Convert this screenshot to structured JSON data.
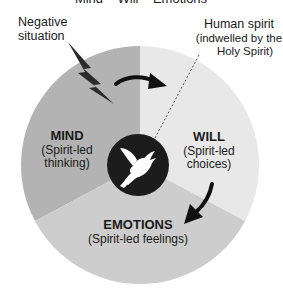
{
  "title": "Mind – Will – Emotions",
  "callouts": {
    "negative_situation": {
      "line1": "Negative",
      "line2": "situation"
    },
    "human_spirit": {
      "line1": "Human spirit",
      "line2": "(indwelled by the",
      "line3": "Holy Spirit)"
    }
  },
  "sectors": {
    "mind": {
      "title": "MIND",
      "sub1": "(Spirit-led",
      "sub2": "thinking)",
      "color": "#b3b3b3"
    },
    "will": {
      "title": "WILL",
      "sub1": "(Spirit-led",
      "sub2": "choices)",
      "color": "#e8e8e8"
    },
    "emotions": {
      "title": "EMOTIONS",
      "sub1": "(Spirit-led feelings)",
      "color": "#cdcdcd"
    }
  },
  "center": {
    "icon": "dove-icon",
    "color": "#1c1c1c"
  },
  "icons": {
    "lightning": "lightning-bolt-icon",
    "arrow_mind_to_will": "curved-arrow-right-icon",
    "arrow_will_to_emotions": "curved-arrow-down-left-icon"
  }
}
